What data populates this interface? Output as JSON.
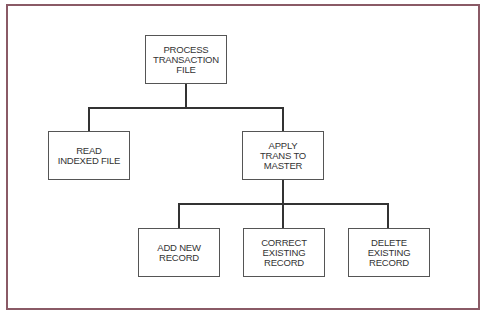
{
  "diagram": {
    "type": "hierarchy-chart",
    "frame_color": "#8a5a66",
    "nodes": {
      "root": {
        "label": "PROCESS\nTRANSACTION\nFILE"
      },
      "read": {
        "label": "READ\nINDEXED FILE"
      },
      "apply": {
        "label": "APPLY\nTRANS TO\nMASTER"
      },
      "add": {
        "label": "ADD NEW\nRECORD"
      },
      "correct": {
        "label": "CORRECT\nEXISTING\nRECORD"
      },
      "delete": {
        "label": "DELETE EXISTING\nRECORD"
      }
    },
    "edges": [
      [
        "root",
        "read"
      ],
      [
        "root",
        "apply"
      ],
      [
        "apply",
        "add"
      ],
      [
        "apply",
        "correct"
      ],
      [
        "apply",
        "delete"
      ]
    ]
  }
}
